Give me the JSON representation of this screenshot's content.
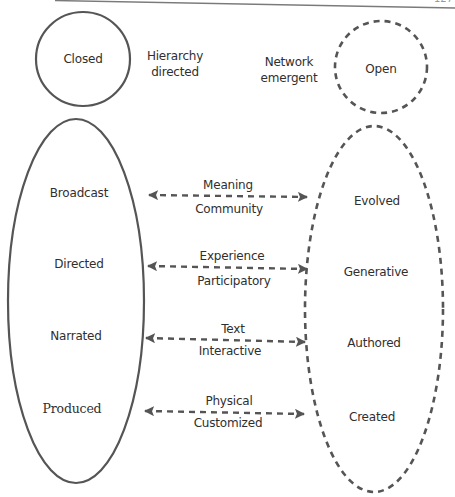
{
  "page": {
    "page_number_partial": "127"
  },
  "top": {
    "closed_label": "Closed",
    "open_label": "Open",
    "hierarchy_line1": "Hierarchy",
    "hierarchy_line2": "directed",
    "network_line1": "Network",
    "network_line2": "emergent"
  },
  "left_column": {
    "items": [
      {
        "label": "Broadcast"
      },
      {
        "label": "Directed"
      },
      {
        "label": "Narrated"
      },
      {
        "label": "Produced"
      }
    ]
  },
  "right_column": {
    "items": [
      {
        "label": "Evolved"
      },
      {
        "label": "Generative"
      },
      {
        "label": "Authored"
      },
      {
        "label": "Created"
      }
    ]
  },
  "arrows": [
    {
      "above": "Meaning",
      "below": "Community"
    },
    {
      "above": "Experience",
      "below": "Participatory"
    },
    {
      "above": "Text",
      "below": "Interactive"
    },
    {
      "above": "Physical",
      "below": "Customized"
    }
  ],
  "colors": {
    "stroke": "#555555",
    "text": "#2f2f2f",
    "rule": "#7a7a7a"
  }
}
